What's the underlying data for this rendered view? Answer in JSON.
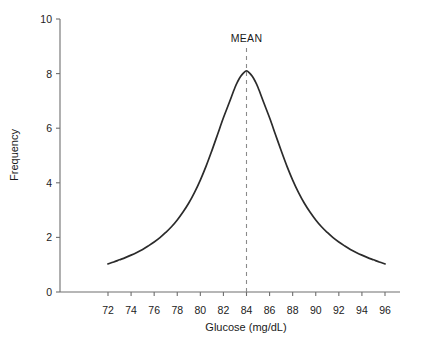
{
  "chart_data": {
    "type": "line",
    "title": "",
    "xlabel": "Glucose (mg/dL)",
    "ylabel": "Frequency",
    "xlim": [
      70.5,
      97.5
    ],
    "ylim": [
      0,
      10
    ],
    "grid": false,
    "legend_position": "none",
    "x_ticks": [
      72,
      74,
      76,
      78,
      80,
      82,
      84,
      86,
      88,
      90,
      92,
      94,
      96
    ],
    "y_ticks": [
      0,
      2,
      4,
      6,
      8,
      10
    ],
    "annotations": [
      {
        "label": "MEAN",
        "type": "vertical-dashed-line",
        "x": 84,
        "y_top": 10,
        "y_bottom": 0
      }
    ],
    "series": [
      {
        "name": "Glucose frequency distribution",
        "peak_x": 84,
        "peak_y": 8.1,
        "x": [
          72,
          72.5,
          73,
          73.5,
          74,
          74.5,
          75,
          75.5,
          76,
          76.5,
          77,
          77.5,
          78,
          78.5,
          79,
          79.5,
          80,
          80.5,
          81,
          81.5,
          82,
          82.5,
          83,
          83.25,
          83.5,
          83.75,
          84,
          84.25,
          84.5,
          84.75,
          85,
          85.5,
          86,
          86.5,
          87,
          87.5,
          88,
          88.5,
          89,
          89.5,
          90,
          90.5,
          91,
          91.5,
          92,
          92.5,
          93,
          93.5,
          94,
          94.5,
          95,
          95.5,
          96
        ],
        "y": [
          1.03,
          1.1,
          1.18,
          1.26,
          1.35,
          1.45,
          1.56,
          1.69,
          1.83,
          1.99,
          2.18,
          2.39,
          2.64,
          2.93,
          3.26,
          3.65,
          4.1,
          4.61,
          5.18,
          5.78,
          6.38,
          6.93,
          7.49,
          7.72,
          7.9,
          8.03,
          8.1,
          8.03,
          7.9,
          7.72,
          7.49,
          6.93,
          6.38,
          5.78,
          5.18,
          4.61,
          4.1,
          3.65,
          3.26,
          2.93,
          2.64,
          2.39,
          2.18,
          1.99,
          1.83,
          1.69,
          1.56,
          1.45,
          1.35,
          1.26,
          1.18,
          1.1,
          1.03
        ]
      }
    ]
  },
  "style": {
    "curve_color": "#2b2b2b",
    "axis_color": "#6e6e6e",
    "mean_line_color": "#8a8a8a",
    "text_color": "#1a1a1a",
    "background": "#ffffff"
  },
  "axes": {
    "y_tick_labels": [
      "0",
      "2",
      "4",
      "6",
      "8",
      "10"
    ],
    "x_tick_labels": [
      "72",
      "74",
      "76",
      "78",
      "80",
      "82",
      "84",
      "86",
      "88",
      "90",
      "92",
      "94",
      "96"
    ],
    "x_title": "Glucose (mg/dL)",
    "y_title": "Frequency"
  },
  "labels": {
    "mean": "MEAN"
  }
}
